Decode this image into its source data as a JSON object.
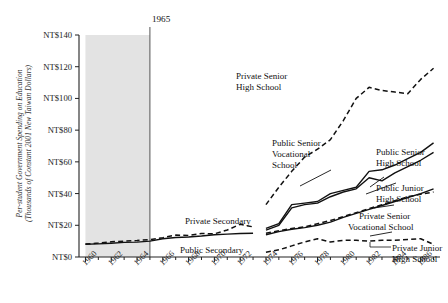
{
  "chart_data": {
    "type": "line",
    "title": "",
    "xlabel": "",
    "ylabel": "Per-student Government Spending on Education (Thousands of Constant 2001 New Taiwan Dollars)",
    "ylabel_line1": "Per-student Government Spending on Education",
    "ylabel_line2": "(Thousands of Constant 2001 New Taiwan Dollars)",
    "xlim": [
      1959.5,
      1987.5
    ],
    "ylim": [
      0,
      140
    ],
    "grid": false,
    "legend_position": "inline-annotations",
    "y_ticks": [
      0,
      20,
      40,
      60,
      80,
      100,
      120,
      140
    ],
    "y_tick_labels": [
      "NT$0",
      "NT$20",
      "NT$40",
      "NT$60",
      "NT$80",
      "NT$100",
      "NT$120",
      "NT$140"
    ],
    "x_ticks": [
      1960,
      1962,
      1964,
      1966,
      1968,
      1970,
      1972,
      1974,
      1976,
      1978,
      1980,
      1982,
      1984,
      1986
    ],
    "x_tick_labels": [
      "1960",
      "1962",
      "1964",
      "1966",
      "1968",
      "1970",
      "1972",
      "1974",
      "1976",
      "1978",
      "1980",
      "1982",
      "1984",
      "1986"
    ],
    "x_minor_ticks": [
      1961,
      1963,
      1965,
      1967,
      1969,
      1971,
      1973,
      1975,
      1977,
      1979,
      1981,
      1983,
      1985,
      1987
    ],
    "annotations": [
      {
        "name": "shaded-region",
        "label": "1965",
        "x_from": 1960,
        "x_to": 1965,
        "note": "grey shaded band ending at vertical rule at 1965"
      }
    ],
    "series": [
      {
        "name": "Public Secondary",
        "style": "solid",
        "label": "Public Secondary",
        "x": [
          1960,
          1961,
          1962,
          1963,
          1964,
          1965,
          1966,
          1967,
          1968,
          1969,
          1970,
          1971,
          1972,
          1973
        ],
        "values": [
          8.0,
          8.3,
          8.7,
          9.2,
          9.4,
          10.0,
          11.5,
          12.3,
          12.6,
          13.2,
          14.0,
          14.4,
          14.8,
          15.0
        ]
      },
      {
        "name": "Private Secondary",
        "style": "dashed",
        "label": "Private Secondary",
        "x": [
          1960,
          1961,
          1962,
          1963,
          1964,
          1965,
          1966,
          1967,
          1968,
          1969,
          1970,
          1971,
          1972,
          1973
        ],
        "values": [
          8.2,
          8.8,
          9.6,
          10.0,
          10.4,
          11.0,
          12.2,
          13.8,
          13.6,
          14.8,
          14.6,
          17.0,
          20.6,
          19.0
        ]
      },
      {
        "name": "Private Senior High School",
        "style": "dashed",
        "label": "Private Senior High School",
        "x": [
          1974,
          1975,
          1976,
          1977,
          1978,
          1979,
          1980,
          1981,
          1982,
          1983,
          1984,
          1985,
          1986,
          1987
        ],
        "values": [
          33.0,
          44.0,
          54.0,
          63.0,
          68.0,
          74.0,
          86.0,
          100.0,
          107.0,
          105.0,
          104.0,
          103.0,
          112.0,
          119.0
        ]
      },
      {
        "name": "Public Senior Vocational School",
        "style": "solid",
        "label": "Public Senior Vocational School",
        "x": [
          1974,
          1975,
          1976,
          1977,
          1978,
          1979,
          1980,
          1981,
          1982,
          1983,
          1984,
          1985,
          1986,
          1987
        ],
        "values": [
          18.0,
          21.0,
          33.0,
          34.0,
          35.0,
          40.0,
          42.0,
          44.0,
          54.0,
          55.0,
          58.0,
          62.0,
          66.0,
          72.0
        ]
      },
      {
        "name": "Public Senior High School",
        "style": "solid",
        "label": "Public Senior High School",
        "x": [
          1974,
          1975,
          1976,
          1977,
          1978,
          1979,
          1980,
          1981,
          1982,
          1983,
          1984,
          1985,
          1986,
          1987
        ],
        "values": [
          17.0,
          20.0,
          31.0,
          33.0,
          34.0,
          38.0,
          41.0,
          43.0,
          50.0,
          48.0,
          53.0,
          57.0,
          61.0,
          66.0
        ]
      },
      {
        "name": "Public Junior High School",
        "style": "solid",
        "label": "Public Junior High School",
        "x": [
          1974,
          1975,
          1976,
          1977,
          1978,
          1979,
          1980,
          1981,
          1982,
          1983,
          1984,
          1985,
          1986,
          1987
        ],
        "values": [
          14.0,
          16.0,
          17.5,
          18.5,
          20.0,
          22.0,
          25.0,
          27.5,
          30.0,
          32.5,
          35.0,
          37.5,
          40.0,
          43.0
        ]
      },
      {
        "name": "Private Senior Vocational School",
        "style": "dashed",
        "label": "Private Senior Vocational School",
        "x": [
          1974,
          1975,
          1976,
          1977,
          1978,
          1979,
          1980,
          1981,
          1982,
          1983,
          1984,
          1985,
          1986,
          1987
        ],
        "values": [
          15.0,
          16.5,
          18.0,
          19.0,
          21.0,
          23.0,
          25.5,
          28.0,
          30.5,
          33.0,
          35.5,
          38.0,
          39.5,
          41.0
        ]
      },
      {
        "name": "Private Junior High School",
        "style": "dashed",
        "label": "Private Junior High School",
        "x": [
          1974,
          1975,
          1976,
          1977,
          1978,
          1979,
          1980,
          1981,
          1982,
          1983,
          1984,
          1985,
          1986,
          1987
        ],
        "values": [
          3.0,
          4.5,
          7.0,
          9.5,
          11.5,
          9.5,
          10.5,
          10.5,
          10.0,
          10.5,
          10.5,
          11.0,
          11.5,
          8.0
        ]
      }
    ],
    "series_labels": {
      "public_secondary": "Public Secondary",
      "private_secondary": "Private Secondary",
      "private_senior_high_l1": "Private Senior",
      "private_senior_high_l2": "High School",
      "public_senior_vocational_l1": "Public Senior",
      "public_senior_vocational_l2": "Vocational",
      "public_senior_vocational_l3": "School",
      "public_senior_high_l1": "Public Senior",
      "public_senior_high_l2": "High School",
      "public_junior_high_l1": "Public Junior",
      "public_junior_high_l2": "High School",
      "private_senior_vocational_l1": "Private Senior",
      "private_senior_vocational_l2": "Vocational School",
      "private_junior_high_l1": "Private Junior",
      "private_junior_high_l2": "High School"
    },
    "colors": {
      "line": "#111111",
      "axis": "#222222",
      "shaded_band": "#e2e2e2",
      "text": "#1a1a1a",
      "background": "#ffffff"
    }
  }
}
